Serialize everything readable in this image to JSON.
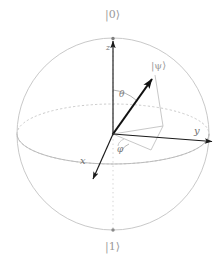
{
  "figure": {
    "type": "diagram",
    "background_color": "#ffffff"
  },
  "colors": {
    "sphere_outline": "#c9c9c9",
    "equator": "#c4c4c4",
    "polar_dotted": "#cfcfcf",
    "axis": "#1a1a1a",
    "state_vector": "#111111",
    "projection": "#bdbdbd",
    "label": "#8a8a8a"
  },
  "labels": {
    "ket_zero": "|0⟩",
    "ket_one": "|1⟩",
    "ket_psi": "|ψ⟩",
    "axis_x": "x",
    "axis_y": "y",
    "axis_z": "z",
    "angle_theta": "θ",
    "angle_phi": "φ"
  },
  "geometry": {
    "center": {
      "x": 113,
      "y": 134
    },
    "radius": 96,
    "equator_ry": 30,
    "state_vector_tip": {
      "x": 155,
      "y": 75
    },
    "projection_point": {
      "x": 163,
      "y": 126
    },
    "axis_y_tip": {
      "x": 215,
      "y": 142
    },
    "axis_x_tip": {
      "x": 92,
      "y": 180
    },
    "axis_z_tip": {
      "x": 113,
      "y": 38
    },
    "pole_north": {
      "x": 113,
      "y": 38
    },
    "pole_south": {
      "x": 113,
      "y": 230
    }
  }
}
